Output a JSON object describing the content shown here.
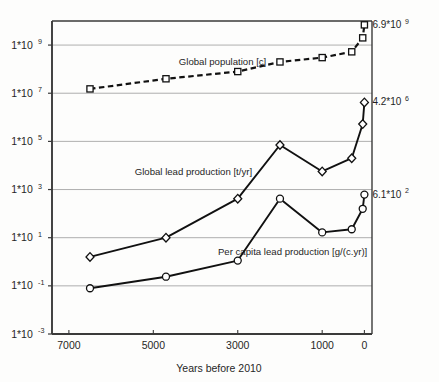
{
  "chart_data": {
    "type": "line",
    "title": "",
    "xlabel": "Years before 2010",
    "ylabel": "",
    "xlim": [
      7400,
      -180
    ],
    "ylim": [
      -3,
      10
    ],
    "yscale": "log",
    "grid": true,
    "legend": "inline-labels",
    "xticks": [
      7000,
      5000,
      3000,
      1000,
      0
    ],
    "xtick_labels": [
      "7000",
      "5000",
      "3000",
      "1000",
      "0"
    ],
    "yticks": [
      9,
      7,
      5,
      3,
      1,
      -1,
      -3
    ],
    "ytick_labels": [
      "1*10",
      "1*10",
      "1*10",
      "1*10",
      "1*10",
      "1*10",
      "1*10"
    ],
    "ytick_exponents": [
      "9",
      "7",
      "5",
      "3",
      "1",
      "-1",
      "-3"
    ],
    "series": [
      {
        "name": "Global population [c]",
        "marker": "square",
        "line": "dashed",
        "label_x": 3360,
        "label_y": 8.18,
        "x": [
          6500,
          4700,
          3000,
          2000,
          1000,
          300,
          40,
          0
        ],
        "y": [
          7.18,
          7.6,
          7.9,
          8.3,
          8.48,
          8.72,
          9.3,
          9.84
        ]
      },
      {
        "name": "Global lead production [t/yr]",
        "marker": "diamond",
        "line": "solid",
        "label_x": 4050,
        "label_y": 3.62,
        "x": [
          6500,
          4700,
          3000,
          2000,
          1000,
          300,
          40,
          0
        ],
        "y": [
          0.2,
          1.0,
          2.62,
          4.85,
          3.75,
          4.3,
          5.72,
          6.62
        ]
      },
      {
        "name": "Per capita lead production [g/(c.yr)]",
        "marker": "circle",
        "line": "solid",
        "label_x": 1700,
        "label_y": 0.3,
        "x": [
          6500,
          4700,
          3000,
          2000,
          1000,
          300,
          40,
          0
        ],
        "y": [
          -1.1,
          -0.62,
          0.05,
          2.62,
          1.22,
          1.35,
          2.2,
          2.79
        ]
      }
    ],
    "annotations": [
      {
        "text": "6.9*10",
        "exp": "9",
        "x": 0,
        "y": 9.84,
        "dx": 8,
        "dy": 3
      },
      {
        "text": "4.2*10",
        "exp": "6",
        "x": 0,
        "y": 6.62,
        "dx": 8,
        "dy": 3
      },
      {
        "text": "6.1*10",
        "exp": "2",
        "x": 0,
        "y": 2.79,
        "dx": 8,
        "dy": 3
      }
    ]
  }
}
